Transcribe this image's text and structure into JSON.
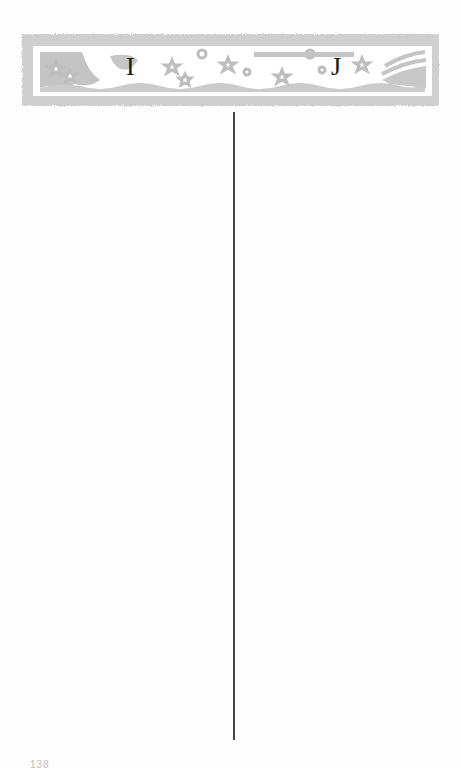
{
  "banner": {
    "left_letter": "I",
    "right_letter": "J",
    "decoration": [
      "star-icon",
      "moon-icon",
      "flower-icon",
      "wave-decoration",
      "cloud-swirl-icon"
    ],
    "frame_color": "#c8c8c8",
    "decoration_color": "#bdbdbd"
  },
  "columns": {
    "left": {
      "heading": "I",
      "entries": []
    },
    "right": {
      "heading": "J",
      "entries": []
    },
    "divider_color": "#444444"
  },
  "footer": {
    "page_number": "138"
  }
}
